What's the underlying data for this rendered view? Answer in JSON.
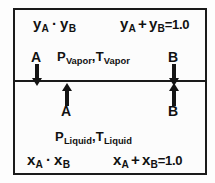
{
  "diagram": {
    "border_color": "#1a1a1a",
    "background_color": "#fcfcfc",
    "vapor": {
      "composition_products": {
        "lhs": "y",
        "sub_a": "A",
        "operator": "·",
        "rhs": "y",
        "sub_b": "B"
      },
      "composition_sum": {
        "lhs": "y",
        "sub_a": "A",
        "operator": "+",
        "rhs": "y",
        "sub_b": "B",
        "equals": "=1.0"
      },
      "properties": {
        "pressure": "P",
        "pressure_sub": "Vapor",
        "separator": ",",
        "temperature": "T",
        "temperature_sub": "Vapor"
      },
      "species_a_label": "A",
      "species_b_label": "B"
    },
    "liquid": {
      "composition_products": {
        "lhs": "x",
        "sub_a": "A",
        "operator": "·",
        "rhs": "x",
        "sub_b": "B"
      },
      "composition_sum": {
        "lhs": "x",
        "sub_a": "A",
        "operator": "+",
        "rhs": "x",
        "sub_b": "B",
        "equals": "=1.0"
      },
      "properties": {
        "pressure": "P",
        "pressure_sub": "Liquid",
        "separator": ",",
        "temperature": "T",
        "temperature_sub": "Liquid"
      },
      "species_a_label": "A",
      "species_b_label": "B"
    },
    "arrows": {
      "a_vapor_direction": "down",
      "b_vapor_direction": "down",
      "a_liquid_direction": "up",
      "b_liquid_direction": "up"
    }
  }
}
